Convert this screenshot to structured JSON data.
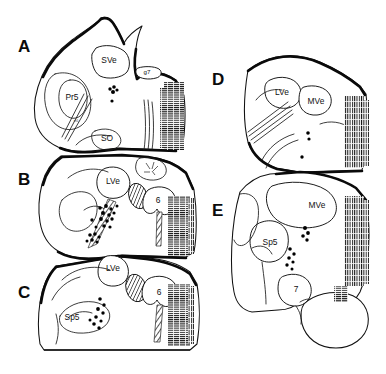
{
  "figure": {
    "kind": "neuroanatomical-section-series",
    "background_color": "#ffffff",
    "ink_color": "#111111",
    "width": 386,
    "height": 374,
    "panel_letters": [
      "A",
      "B",
      "C",
      "D",
      "E"
    ],
    "description_note": "Line-drawing brainstem coronal sections with retrogradely labelled cells shown as black dots"
  },
  "panels": [
    {
      "id": "A",
      "letter": "A",
      "letter_x": 18,
      "letter_y": 52,
      "column": "left",
      "labels": [
        {
          "name": "SVe",
          "text": "SVe",
          "x": 109,
          "y": 63,
          "size": "normal"
        },
        {
          "name": "g7",
          "text": "g7",
          "x": 145,
          "y": 73,
          "size": "small"
        },
        {
          "name": "Pr5",
          "text": "Pr5",
          "x": 64,
          "y": 99,
          "size": "normal"
        },
        {
          "name": "SO",
          "text": "SO",
          "x": 106,
          "y": 140,
          "size": "normal"
        },
        {
          "name": "m5",
          "text": "m5",
          "x": 74,
          "y": 119,
          "size": "tiny"
        }
      ],
      "cell_clusters": [
        {
          "name": "dot-cluster-a1",
          "cx": 113,
          "cy": 92,
          "count": 5
        }
      ]
    },
    {
      "id": "B",
      "letter": "B",
      "letter_x": 18,
      "letter_y": 185,
      "column": "left",
      "labels": [
        {
          "name": "LVe",
          "text": "LVe",
          "x": 112,
          "y": 181,
          "size": "normal"
        },
        {
          "name": "6",
          "text": "6",
          "x": 155,
          "y": 200,
          "size": "normal"
        }
      ],
      "cell_clusters": [
        {
          "name": "dot-cluster-b1",
          "cx": 104,
          "cy": 216,
          "count": 14
        },
        {
          "name": "dot-cluster-b2",
          "cx": 95,
          "cy": 238,
          "count": 6
        }
      ]
    },
    {
      "id": "C",
      "letter": "C",
      "letter_x": 18,
      "letter_y": 298,
      "column": "left",
      "labels": [
        {
          "name": "LVe",
          "text": "LVe",
          "x": 113,
          "y": 267,
          "size": "normal"
        },
        {
          "name": "6",
          "text": "6",
          "x": 155,
          "y": 291,
          "size": "normal"
        },
        {
          "name": "Sp5",
          "text": "Sp5",
          "x": 67,
          "y": 318,
          "size": "normal"
        }
      ],
      "cell_clusters": [
        {
          "name": "dot-cluster-c1",
          "cx": 97,
          "cy": 313,
          "count": 9
        }
      ]
    },
    {
      "id": "D",
      "letter": "D",
      "letter_x": 212,
      "letter_y": 85,
      "column": "right",
      "labels": [
        {
          "name": "LVe",
          "text": "LVe",
          "x": 280,
          "y": 92,
          "size": "normal"
        },
        {
          "name": "MVe",
          "text": "MVe",
          "x": 312,
          "y": 101,
          "size": "normal"
        }
      ],
      "cell_clusters": [
        {
          "name": "dot-cluster-d1",
          "cx": 308,
          "cy": 136,
          "count": 2
        },
        {
          "name": "dot-cluster-d2",
          "cx": 302,
          "cy": 157,
          "count": 1
        }
      ]
    },
    {
      "id": "E",
      "letter": "E",
      "letter_x": 212,
      "letter_y": 216,
      "column": "right",
      "labels": [
        {
          "name": "MVe",
          "text": "MVe",
          "x": 313,
          "y": 205,
          "size": "normal"
        },
        {
          "name": "Sp5",
          "text": "Sp5",
          "x": 269,
          "y": 242,
          "size": "normal"
        },
        {
          "name": "7",
          "text": "7",
          "x": 296,
          "y": 288,
          "size": "normal"
        }
      ],
      "cell_clusters": [
        {
          "name": "dot-cluster-e1",
          "cx": 305,
          "cy": 233,
          "count": 4
        },
        {
          "name": "dot-cluster-e2",
          "cx": 292,
          "cy": 257,
          "count": 6
        }
      ]
    }
  ],
  "abbreviations": {
    "SVe": "superior vestibular nucleus",
    "MVe": "medial vestibular nucleus",
    "LVe": "lateral vestibular nucleus",
    "Pr5": "principal sensory trigeminal nucleus",
    "Sp5": "spinal trigeminal nucleus",
    "SO": "superior olive",
    "g7": "genu of the facial nerve",
    "6": "abducens nucleus",
    "7": "facial nucleus",
    "m5": "motor trigeminal tract"
  }
}
